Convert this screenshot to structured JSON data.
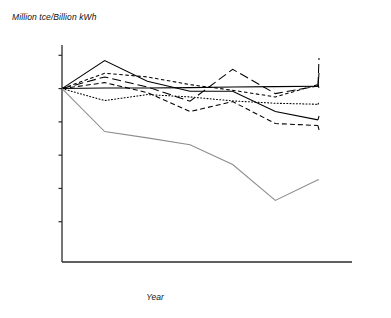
{
  "chart_data": {
    "type": "line",
    "title": "",
    "ylabel": "Million tce/Billion kWh",
    "xlabel": "Year",
    "x": [
      2004,
      2005,
      2006,
      2007,
      2008,
      2009,
      2010
    ],
    "categories": [
      "2004",
      "2005",
      "2006",
      "2007",
      "2008",
      "2009",
      "2010"
    ],
    "xtick_labels": [
      "2004",
      "2005",
      "2006",
      "2007",
      "2008",
      "2009",
      "2010"
    ],
    "ytick_labels": [
      "1.01",
      "1",
      "0.99",
      "0.98",
      "0.97",
      "0.96",
      "0.96"
    ],
    "ytick_values": [
      1.01,
      1.0,
      0.99,
      0.98,
      0.97,
      0.96,
      0.95
    ],
    "ylim": [
      0.9479,
      1.0131
    ],
    "xlim": [
      2004,
      2010
    ],
    "grid": false,
    "legend_position": "right-inline",
    "series": [
      {
        "name": "North",
        "style": "long-dash",
        "color": "#000000",
        "values": [
          1.0,
          1.0035,
          1.0005,
          0.9962,
          1.0058,
          0.9985,
          1.0008
        ]
      },
      {
        "name": "Hainan",
        "style": "solid",
        "color": "#000000",
        "values": [
          1.0,
          1.0002,
          1.0002,
          1.0003,
          1.0005,
          1.0006,
          1.0007
        ]
      },
      {
        "name": "Northwest",
        "style": "short-dash",
        "color": "#000000",
        "values": [
          1.0,
          1.0046,
          1.0035,
          1.0012,
          0.9995,
          0.9975,
          1.0012
        ]
      },
      {
        "name": "Northeast",
        "style": "dotted",
        "color": "#000000",
        "values": [
          1.0,
          0.9964,
          0.9982,
          0.9975,
          0.9963,
          0.9956,
          0.9953
        ]
      },
      {
        "name": "South",
        "style": "solid",
        "color": "#000000",
        "values": [
          1.0,
          1.0084,
          1.0022,
          0.9992,
          0.9992,
          0.9931,
          0.9906
        ]
      },
      {
        "name": "East",
        "style": "dash",
        "color": "#000000",
        "values": [
          1.0,
          1.0018,
          0.9988,
          0.9931,
          0.9961,
          0.9895,
          0.9889
        ]
      },
      {
        "name": "Central",
        "style": "solid-gray",
        "color": "#8d8d8d",
        "values": [
          1.0,
          0.9871,
          0.9852,
          0.9831,
          0.9772,
          0.9664,
          0.9726
        ]
      }
    ],
    "legend_entries": [
      {
        "label": "North"
      },
      {
        "label": "Hainan"
      },
      {
        "label": "Northwest"
      },
      {
        "label": "Northeast"
      },
      {
        "label": "South"
      },
      {
        "label": "East"
      },
      {
        "label": "Central"
      }
    ]
  }
}
